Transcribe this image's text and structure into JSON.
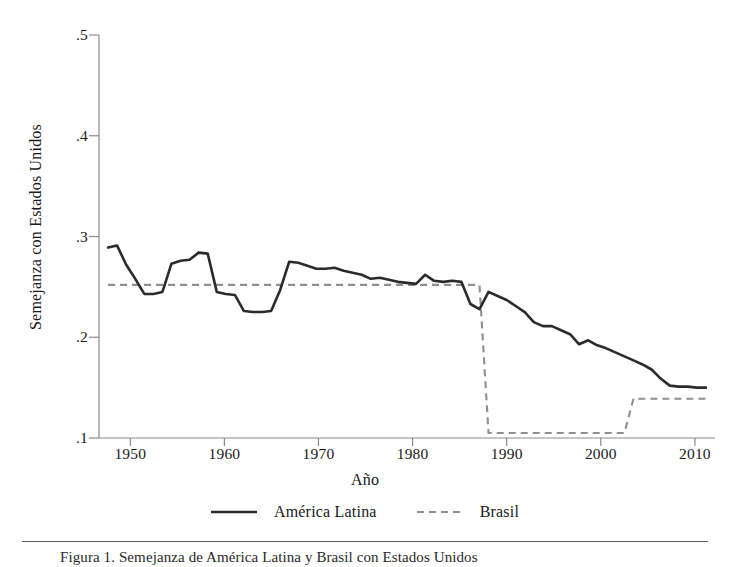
{
  "figure": {
    "caption": "Figura 1. Semejanza de América Latina y Brasil con Estados Unidos",
    "background": "#ffffff"
  },
  "chart_data": {
    "type": "line",
    "title": "",
    "xlabel": "Año",
    "ylabel": "Semejanza con Estados Unidos",
    "xlim": [
      1945,
      2013
    ],
    "ylim": [
      0.1,
      0.5
    ],
    "xticks": [
      1950,
      1960,
      1970,
      1980,
      1990,
      2000,
      2010
    ],
    "xtick_labels": [
      "1950",
      "1960",
      "1970",
      "1980",
      "1990",
      "2000",
      "2010"
    ],
    "yticks": [
      0.1,
      0.2,
      0.3,
      0.4,
      0.5
    ],
    "ytick_labels": [
      ".1",
      ".2",
      ".3",
      ".4",
      ".5"
    ],
    "grid": false,
    "legend_position": "below",
    "series": [
      {
        "name": "América Latina",
        "style": "solid",
        "color": "#2b2b2b",
        "width": 2.6,
        "x": [
          1946,
          1947,
          1948,
          1949,
          1950,
          1951,
          1952,
          1953,
          1954,
          1955,
          1956,
          1957,
          1958,
          1959,
          1960,
          1961,
          1962,
          1963,
          1964,
          1965,
          1966,
          1967,
          1968,
          1969,
          1970,
          1971,
          1972,
          1973,
          1974,
          1975,
          1976,
          1977,
          1978,
          1979,
          1980,
          1981,
          1982,
          1983,
          1984,
          1985,
          1986,
          1987,
          1988,
          1989,
          1990,
          1991,
          1992,
          1993,
          1994,
          1995,
          1996,
          1997,
          1998,
          1999,
          2000,
          2001,
          2002,
          2003,
          2004,
          2005,
          2006,
          2007,
          2008,
          2009,
          2010,
          2011,
          2012
        ],
        "y": [
          0.289,
          0.291,
          0.272,
          0.258,
          0.243,
          0.243,
          0.245,
          0.273,
          0.276,
          0.277,
          0.284,
          0.283,
          0.245,
          0.243,
          0.242,
          0.226,
          0.225,
          0.225,
          0.226,
          0.247,
          0.275,
          0.274,
          0.271,
          0.268,
          0.268,
          0.269,
          0.266,
          0.264,
          0.262,
          0.258,
          0.259,
          0.257,
          0.255,
          0.254,
          0.253,
          0.262,
          0.256,
          0.255,
          0.256,
          0.255,
          0.233,
          0.228,
          0.245,
          0.241,
          0.237,
          0.231,
          0.225,
          0.215,
          0.211,
          0.211,
          0.207,
          0.203,
          0.193,
          0.197,
          0.192,
          0.189,
          0.185,
          0.181,
          0.177,
          0.173,
          0.168,
          0.159,
          0.152,
          0.151,
          0.151,
          0.15,
          0.15
        ]
      },
      {
        "name": "Brasil",
        "style": "dashed",
        "color": "#8f8f8f",
        "width": 2.1,
        "x": [
          1946,
          1986,
          1987,
          1988,
          2002,
          2003,
          2004,
          2012
        ],
        "y": [
          0.252,
          0.252,
          0.252,
          0.105,
          0.105,
          0.105,
          0.139,
          0.139
        ]
      }
    ]
  },
  "legend": {
    "entries": [
      {
        "label": "América Latina",
        "style": "solid",
        "color": "#2b2b2b"
      },
      {
        "label": "Brasil",
        "style": "dashed",
        "color": "#8f8f8f"
      }
    ]
  }
}
